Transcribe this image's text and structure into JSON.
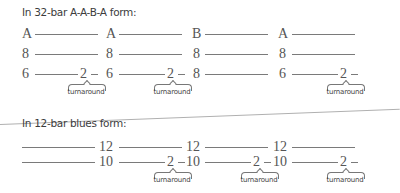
{
  "sections": {
    "aaba": {
      "heading": "In 32-bar A-A-B-A form:",
      "row1": [
        "A",
        "A",
        "B",
        "A"
      ],
      "row2": [
        "8",
        "8",
        "8",
        "8"
      ],
      "row3": [
        "6",
        "2",
        "6",
        "2",
        "8",
        "6",
        "2"
      ],
      "turnaround": "turnaround"
    },
    "blues": {
      "heading": "In 12-bar blues form:",
      "row1": [
        "12",
        "12",
        "12"
      ],
      "row2": [
        "10",
        "2",
        "10",
        "2",
        "10",
        "2"
      ],
      "turnaround": "turnaround"
    }
  }
}
